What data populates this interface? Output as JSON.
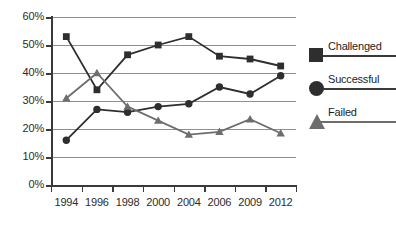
{
  "chart_data": {
    "type": "line",
    "title": "",
    "xlabel": "",
    "ylabel": "",
    "categories": [
      "1994",
      "1996",
      "1998",
      "2000",
      "2004",
      "2006",
      "2009",
      "2012"
    ],
    "ylim": [
      0,
      60
    ],
    "yticks": [
      "0%",
      "10%",
      "20%",
      "30%",
      "40%",
      "50%",
      "60%"
    ],
    "ytick_values": [
      0,
      10,
      20,
      30,
      40,
      50,
      60
    ],
    "grid": true,
    "legend_position": "right",
    "series": [
      {
        "name": "Challenged",
        "marker": "square",
        "color": "#2e2e2e",
        "values": [
          53,
          34,
          46.5,
          50,
          53,
          46,
          45,
          42.5
        ]
      },
      {
        "name": "Successful",
        "marker": "circle",
        "color": "#2e2e2e",
        "values": [
          16,
          27,
          26,
          28,
          29,
          35,
          32.5,
          39
        ]
      },
      {
        "name": "Failed",
        "marker": "triangle",
        "color": "#6d6d6d",
        "values": [
          31,
          40,
          28,
          23,
          18,
          19,
          23.5,
          18.5
        ]
      }
    ]
  },
  "legend": {
    "items": [
      {
        "label": "Challenged",
        "marker": "square-marker-icon"
      },
      {
        "label": "Successful",
        "marker": "circle-marker-icon"
      },
      {
        "label": "Failed",
        "marker": "triangle-marker-icon"
      }
    ]
  },
  "colors": {
    "axis": "#3a3a3a",
    "grid": "#8f8f8f",
    "dark_series": "#2e2e2e",
    "light_series": "#6d6d6d",
    "background": "#ffffff"
  }
}
